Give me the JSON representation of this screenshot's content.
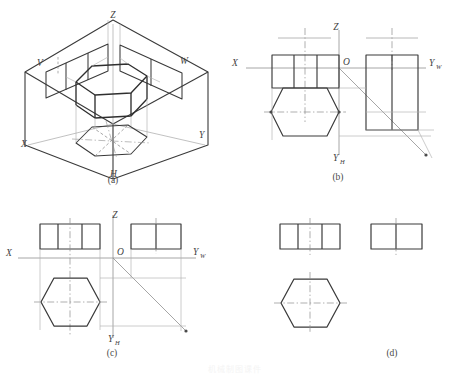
{
  "figure": {
    "background_color": "#ffffff",
    "line_color_solid": "#3a3a3a",
    "line_color_thin": "#9a9a9a",
    "line_color_center": "#8e8e8e",
    "bottom_faint_text": "机械制图课件"
  },
  "panels": [
    {
      "id": "a",
      "caption": "(a)",
      "description": "Pictorial view of the three mutually perpendicular projection planes V, H, W with the object and its three projections",
      "labels": [
        {
          "name": "axis-label-z",
          "text": "Z",
          "x": 113,
          "y": 14
        },
        {
          "name": "plane-label-v",
          "text": "V",
          "x": 39,
          "y": 63
        },
        {
          "name": "plane-label-w",
          "text": "W",
          "x": 183,
          "y": 61
        },
        {
          "name": "axis-label-x",
          "text": "X",
          "x": 24,
          "y": 143
        },
        {
          "name": "axis-label-y",
          "text": "Y",
          "x": 200,
          "y": 134
        },
        {
          "name": "plane-label-h",
          "text": "H",
          "x": 111,
          "y": 172
        }
      ]
    },
    {
      "id": "b",
      "caption": "(b)",
      "description": "Projection planes unfolded, projections still joined by construction lines; front view, top view and side view with 45 degree mitre line",
      "labels": [
        {
          "name": "axis-label-z",
          "text": "Z",
          "x": 110,
          "y": 28
        },
        {
          "name": "axis-label-x",
          "text": "X",
          "x": 9,
          "y": 63
        },
        {
          "name": "origin-label-o",
          "text": "O",
          "x": 116,
          "y": 68
        },
        {
          "name": "axis-label-yw",
          "text": "Y",
          "sub": "W",
          "x": 198,
          "y": 63
        },
        {
          "name": "axis-label-yh",
          "text": "Y",
          "sub": "H",
          "x": 111,
          "y": 157
        }
      ]
    },
    {
      "id": "c",
      "caption": "(c)",
      "description": "Three views arranged in standard positions with projection axes, mitre line and construction lines retained",
      "labels": [
        {
          "name": "axis-label-z",
          "text": "Z",
          "x": 114,
          "y": 28
        },
        {
          "name": "axis-label-x",
          "text": "X",
          "x": 10,
          "y": 61
        },
        {
          "name": "origin-label-o",
          "text": "O",
          "x": 114,
          "y": 63
        },
        {
          "name": "axis-label-yw",
          "text": "Y",
          "sub": "W",
          "x": 190,
          "y": 61
        },
        {
          "name": "axis-label-yh",
          "text": "Y",
          "sub": "H",
          "x": 114,
          "y": 143
        }
      ]
    },
    {
      "id": "d",
      "caption": "(d)",
      "description": "Finished three-view drawing with axes and construction lines removed; front view, side view and top view",
      "labels": []
    }
  ],
  "views": {
    "front_view": {
      "name": "front-view",
      "divisions": 3,
      "outline": "rectangle"
    },
    "side_view": {
      "name": "side-view",
      "divisions": 2,
      "outline": "rectangle"
    },
    "top_view": {
      "name": "top-view",
      "divisions": 0,
      "outline": "hexagon"
    }
  }
}
